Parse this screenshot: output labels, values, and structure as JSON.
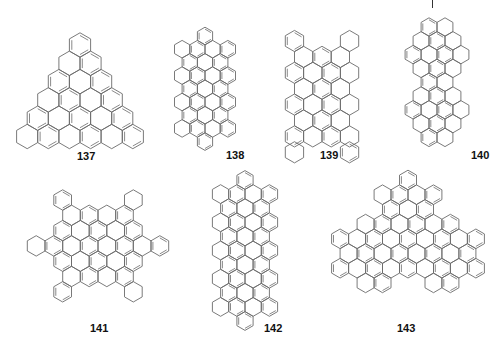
{
  "figure": {
    "stroke_color": "#6b6b6b",
    "label_color": "#111111",
    "top_mark": {
      "x": 432,
      "y": 0,
      "height": 8
    }
  },
  "molecules": [
    {
      "id": "137",
      "label": "137",
      "shape": "triangle",
      "cx": 80,
      "cy": 45,
      "s": 12.2,
      "label_pos": {
        "x": 77,
        "y": 151
      },
      "rows": [
        [
          0
        ],
        [
          -1,
          1
        ],
        [
          -2,
          0,
          2
        ],
        [
          -3,
          -1,
          1,
          3
        ],
        [
          -4,
          -2,
          0,
          2,
          4
        ],
        [
          -5,
          -3,
          -1,
          1,
          3,
          5
        ]
      ]
    },
    {
      "id": "138",
      "label": "138",
      "shape": "rectangle-capped",
      "cx": 205,
      "cy": 36,
      "s": 8.8,
      "label_pos": {
        "x": 226,
        "y": 150
      },
      "rows": [
        [
          0
        ],
        [
          -3,
          -1,
          1,
          3
        ],
        [
          -2,
          0,
          2
        ],
        [
          -3,
          -1,
          1,
          3
        ],
        [
          -2,
          0,
          2
        ],
        [
          -3,
          -1,
          1,
          3
        ],
        [
          -2,
          0,
          2
        ],
        [
          -3,
          -1,
          1,
          3
        ],
        [
          0
        ]
      ]
    },
    {
      "id": "139",
      "label": "139",
      "shape": "rectangle",
      "cx": 322,
      "cy": 41,
      "s": 10.6,
      "label_pos": {
        "x": 320,
        "y": 150
      },
      "rows": [
        [
          -3,
          3
        ],
        [
          -2,
          0,
          2
        ],
        [
          -3,
          -1,
          1,
          3
        ],
        [
          -2,
          0,
          2
        ],
        [
          -3,
          -1,
          1,
          3
        ],
        [
          -2,
          0,
          2
        ],
        [
          -3,
          -1,
          1,
          3
        ],
        [
          -3,
          3
        ]
      ]
    },
    {
      "id": "140",
      "label": "140",
      "shape": "elongated",
      "cx": 437,
      "cy": 27,
      "s": 9.2,
      "label_pos": {
        "x": 471,
        "y": 150
      },
      "rows": [
        [
          -1,
          1
        ],
        [
          -2,
          0,
          2
        ],
        [
          -3,
          -1,
          1,
          3
        ],
        [
          -2,
          0,
          2
        ],
        [
          -1,
          1
        ],
        [
          -2,
          0,
          2
        ],
        [
          -3,
          -1,
          1,
          3
        ],
        [
          -2,
          0,
          2
        ],
        [
          -1,
          1
        ]
      ]
    },
    {
      "id": "141",
      "label": "141",
      "shape": "star",
      "cx": 98,
      "cy": 200,
      "s": 10.2,
      "label_pos": {
        "x": 90,
        "y": 323
      },
      "rows": [
        [
          -4,
          4
        ],
        [
          -3,
          -1,
          1,
          3
        ],
        [
          -4,
          -2,
          0,
          2,
          4
        ],
        [
          -7,
          -5,
          -3,
          -1,
          1,
          3,
          5,
          7
        ],
        [
          -4,
          -2,
          0,
          2,
          4
        ],
        [
          -3,
          -1,
          1,
          3
        ],
        [
          -4,
          4
        ]
      ]
    },
    {
      "id": "142",
      "label": "142",
      "shape": "rectangle-capped",
      "cx": 245,
      "cy": 180,
      "s": 9.4,
      "label_pos": {
        "x": 264,
        "y": 323
      },
      "rows": [
        [
          0
        ],
        [
          -3,
          -1,
          1,
          3
        ],
        [
          -2,
          0,
          2
        ],
        [
          -3,
          -1,
          1,
          3
        ],
        [
          -2,
          0,
          2
        ],
        [
          -3,
          -1,
          1,
          3
        ],
        [
          -2,
          0,
          2
        ],
        [
          -3,
          -1,
          1,
          3
        ],
        [
          -2,
          0,
          2
        ],
        [
          -3,
          -1,
          1,
          3
        ],
        [
          0
        ]
      ]
    },
    {
      "id": "143",
      "label": "143",
      "shape": "triangle",
      "cx": 408,
      "cy": 180,
      "s": 9.8,
      "label_pos": {
        "x": 397,
        "y": 323
      },
      "rows": [
        [
          0
        ],
        [
          -3,
          -1,
          1,
          3
        ],
        [
          -2,
          0,
          2
        ],
        [
          -5,
          -3,
          -1,
          1,
          3,
          5
        ],
        [
          -8,
          -6,
          -4,
          -2,
          0,
          2,
          4,
          6,
          8
        ],
        [
          -7,
          -5,
          -3,
          -1,
          1,
          3,
          5,
          7
        ],
        [
          -8,
          -6,
          -4,
          -2,
          0,
          2,
          4,
          6,
          8
        ],
        [
          -5,
          -3,
          3,
          5
        ]
      ]
    }
  ]
}
